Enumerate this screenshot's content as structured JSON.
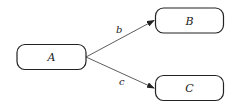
{
  "diagram": {
    "type": "directed-graph",
    "nodes": [
      {
        "id": "A",
        "label": "A",
        "x": 17,
        "y": 44,
        "w": 69,
        "h": 26
      },
      {
        "id": "B",
        "label": "B",
        "x": 155,
        "y": 8,
        "w": 69,
        "h": 25
      },
      {
        "id": "C",
        "label": "C",
        "x": 155,
        "y": 75,
        "w": 69,
        "h": 25
      }
    ],
    "edges": [
      {
        "from": "A",
        "to": "B",
        "label": "b"
      },
      {
        "from": "A",
        "to": "C",
        "label": "c"
      }
    ],
    "colors": {
      "stroke": "#222222",
      "background": "#ffffff"
    }
  }
}
